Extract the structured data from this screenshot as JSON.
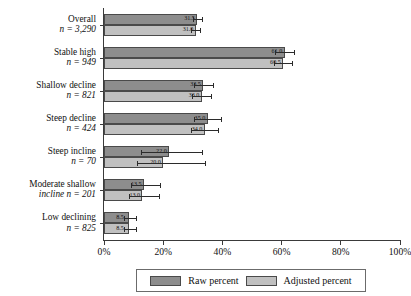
{
  "chart_data": {
    "type": "bar",
    "orientation": "horizontal",
    "title": "",
    "xlabel": "",
    "ylabel": "",
    "xlim": [
      0,
      100
    ],
    "xticks": [
      0,
      20,
      40,
      60,
      80,
      100
    ],
    "xtick_labels": [
      "0%",
      "20%",
      "40%",
      "60%",
      "80%",
      "100%"
    ],
    "grid": false,
    "legend_position": "bottom",
    "categories": [
      {
        "name": "Overall",
        "n_label": "n = 3,290",
        "n": 3290,
        "two_line": false
      },
      {
        "name": "Stable high",
        "n_label": "n = 949",
        "n": 949,
        "two_line": false
      },
      {
        "name": "Shallow decline",
        "n_label": "n = 821",
        "n": 821,
        "two_line": false
      },
      {
        "name": "Steep decline",
        "n_label": "n = 424",
        "n": 424,
        "two_line": false
      },
      {
        "name": "Steep incline",
        "n_label": "n = 70",
        "n": 70,
        "two_line": false
      },
      {
        "name": "Moderate shallow",
        "n_label": "incline n = 201",
        "n": 201,
        "two_line": true
      },
      {
        "name": "Low declining",
        "n_label": "n = 825",
        "n": 825,
        "two_line": false
      }
    ],
    "series": [
      {
        "name": "Raw percent",
        "color": "#8d8d8d",
        "values": [
          31.5,
          61.0,
          33.5,
          35.0,
          22.0,
          13.5,
          8.5
        ],
        "value_labels": [
          "31.5",
          "61.0",
          "33.5",
          "35.0",
          "22.0",
          "13.5",
          "8.5"
        ],
        "err_low": [
          29.9,
          57.9,
          30.3,
          30.5,
          12.5,
          9.0,
          6.6
        ],
        "err_high": [
          33.1,
          64.1,
          36.7,
          39.5,
          33.0,
          19.0,
          10.8
        ]
      },
      {
        "name": "Adjusted percent",
        "color": "#c0c0c0",
        "values": [
          31.0,
          60.5,
          33.0,
          34.0,
          20.0,
          13.0,
          8.5
        ],
        "value_labels": [
          "31.0",
          "60.5",
          "33.0",
          "34.0",
          "20.0",
          "13.0",
          "8.5"
        ],
        "err_low": [
          29.4,
          57.4,
          29.8,
          29.5,
          11.0,
          8.5,
          6.6
        ],
        "err_high": [
          32.6,
          63.6,
          36.2,
          38.5,
          34.0,
          18.5,
          10.8
        ]
      }
    ]
  },
  "legend": {
    "raw_label": "Raw percent",
    "adjusted_label": "Adjusted percent"
  }
}
